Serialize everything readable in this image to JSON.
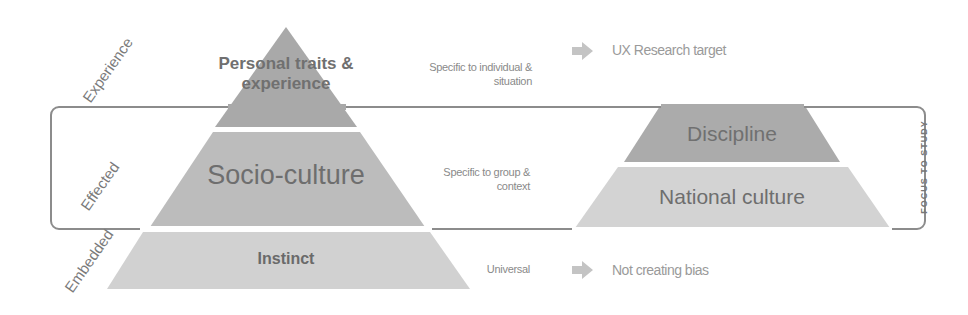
{
  "levels": {
    "experience": "Experience",
    "effected": "Effected",
    "embedded": "Embedded"
  },
  "left_pyramid": {
    "layers": [
      {
        "label": "Personal traits & experience",
        "line1": "Personal traits &",
        "line2": "experience",
        "color": "#a9a9a9"
      },
      {
        "label": "Socio-culture",
        "color": "#bcbcbc"
      },
      {
        "label": "Instinct",
        "color": "#d1d1d1"
      }
    ]
  },
  "notes": {
    "top_line1": "Specific to individual &",
    "top_line2": "situation",
    "middle_line1": "Specific to group &",
    "middle_line2": "context",
    "bottom": "Universal"
  },
  "targets": {
    "top": "UX Research target",
    "bottom": "Not creating bias",
    "arrow_color": "#c4c4c4"
  },
  "right_pyramid": {
    "layers": [
      {
        "label": "Discipline",
        "color": "#ababab"
      },
      {
        "label": "National culture",
        "color": "#d3d3d3"
      }
    ]
  },
  "focus_box": {
    "label": "FOCUS TO STUDY",
    "border_color": "#8c8c8c"
  }
}
